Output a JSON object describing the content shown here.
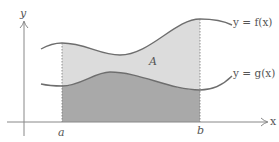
{
  "diagram": {
    "axes": {
      "x_label": "x",
      "y_label": "y"
    },
    "bounds": {
      "left": "a",
      "right": "b"
    },
    "curves": [
      {
        "name": "f",
        "label": "y = f(x)",
        "role": "upper"
      },
      {
        "name": "g",
        "label": "y = g(x)",
        "role": "lower"
      }
    ],
    "region_label": "A",
    "colors": {
      "curve": "#6e6e6e",
      "axis": "#888888",
      "upper_region": "#dcdcdc",
      "lower_region": "#a9a9a9",
      "text": "#555555"
    }
  }
}
